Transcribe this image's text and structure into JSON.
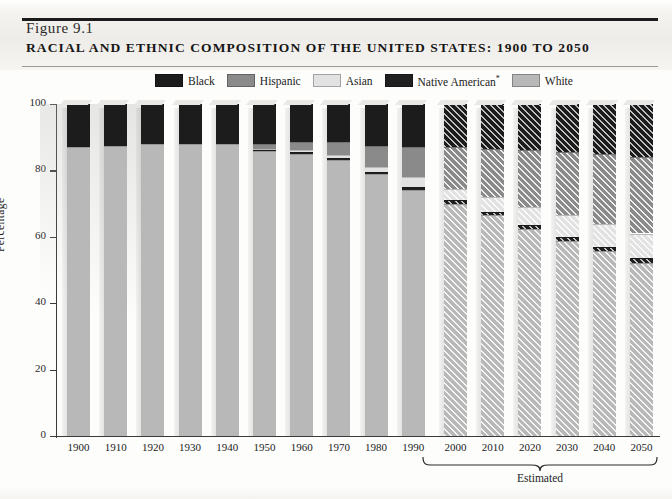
{
  "figure": {
    "number": "Figure 9.1",
    "title": "Racial and Ethnic Composition of the United States: 1900 to 2050"
  },
  "colors": {
    "black": "#1c1c1c",
    "hispanic": "#8a8a8a",
    "asian": "#e2e2e2",
    "native_american": "#202020",
    "white": "#b8b8b8",
    "axis": "#3a3a3a",
    "paper": "#fdfdfc"
  },
  "legend": {
    "position": "top-center",
    "items": [
      {
        "label": "Black",
        "key": "black",
        "color": "#1c1c1c"
      },
      {
        "label": "Hispanic",
        "key": "hispanic",
        "color": "#8a8a8a"
      },
      {
        "label": "Asian",
        "key": "asian",
        "color": "#e2e2e2"
      },
      {
        "label": "Native American*",
        "key": "native_american",
        "color": "#202020"
      },
      {
        "label": "White",
        "key": "white",
        "color": "#b8b8b8"
      }
    ]
  },
  "axes": {
    "ylabel": "Percentage",
    "yticks": [
      "0",
      "20",
      "40",
      "60",
      "80",
      "100"
    ],
    "ylim": [
      0,
      100
    ],
    "xlabel": "",
    "grid": false
  },
  "annotations": {
    "estimated_label": "Estimated",
    "estimated_years": [
      "2000",
      "2010",
      "2020",
      "2030",
      "2040",
      "2050"
    ],
    "footnote_marker": "*"
  },
  "chart_data": {
    "type": "bar",
    "subtype": "stacked-column-100",
    "title": "Racial and Ethnic Composition of the United States: 1900 to 2050",
    "xlabel": "",
    "ylabel": "Percentage",
    "ylim": [
      0,
      100
    ],
    "grid": false,
    "legend_position": "top-center",
    "categories": [
      "1900",
      "1910",
      "1920",
      "1930",
      "1940",
      "1950",
      "1960",
      "1970",
      "1980",
      "1990",
      "2000",
      "2010",
      "2020",
      "2030",
      "2040",
      "2050"
    ],
    "estimated_from": "2000",
    "stack_order_top_to_bottom": [
      "Black",
      "Hispanic",
      "Asian",
      "Native American*",
      "White"
    ],
    "series": [
      {
        "name": "Black",
        "color": "#1c1c1c",
        "values": [
          13.0,
          12.5,
          12.0,
          12.0,
          12.0,
          12.0,
          11.5,
          11.5,
          12.5,
          13.0,
          13.0,
          13.5,
          14.0,
          14.5,
          15.0,
          16.0
        ]
      },
      {
        "name": "Hispanic",
        "color": "#8a8a8a",
        "values": [
          0.0,
          0.0,
          0.0,
          0.0,
          0.0,
          1.5,
          2.5,
          4.0,
          6.5,
          9.0,
          12.5,
          14.5,
          17.0,
          19.0,
          21.0,
          23.0
        ]
      },
      {
        "name": "Asian",
        "color": "#e2e2e2",
        "values": [
          0.0,
          0.0,
          0.0,
          0.0,
          0.0,
          0.3,
          0.5,
          0.8,
          1.5,
          3.0,
          3.5,
          4.5,
          5.5,
          6.5,
          7.0,
          7.5
        ]
      },
      {
        "name": "Native American*",
        "color": "#202020",
        "values": [
          0.0,
          0.0,
          0.0,
          0.0,
          0.0,
          0.4,
          0.5,
          0.5,
          0.7,
          0.8,
          1.0,
          1.0,
          1.2,
          1.3,
          1.4,
          1.5
        ]
      },
      {
        "name": "White",
        "color": "#b8b8b8",
        "values": [
          87.0,
          87.5,
          88.0,
          88.0,
          88.0,
          85.8,
          85.0,
          83.2,
          78.8,
          74.2,
          70.0,
          66.5,
          62.3,
          58.7,
          55.6,
          52.0
        ]
      }
    ]
  }
}
